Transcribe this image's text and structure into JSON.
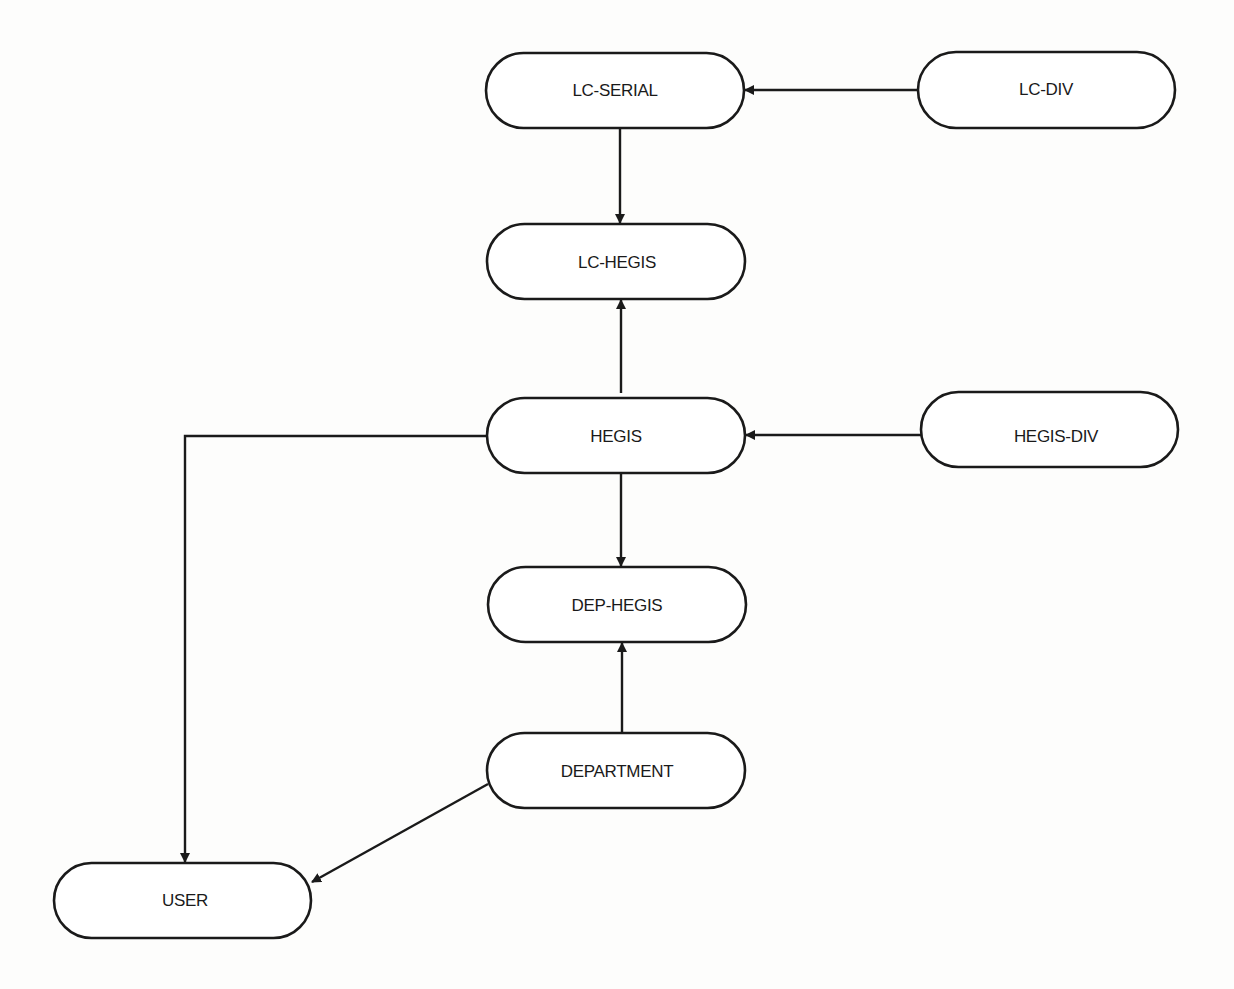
{
  "diagram": {
    "type": "entity-relationship / dependency diagram",
    "colors": {
      "background": "#fdfdfc",
      "stroke": "#1a1a1a",
      "node_fill": "#ffffff",
      "text": "#1a1a1a"
    },
    "nodes": [
      {
        "id": "lc_serial",
        "label": "LC-SERIAL",
        "x": 486,
        "y": 53,
        "w": 258,
        "h": 75
      },
      {
        "id": "lc_div",
        "label": "LC-DIV",
        "x": 918,
        "y": 52,
        "w": 257,
        "h": 76
      },
      {
        "id": "lc_hegis",
        "label": "LC-HEGIS",
        "x": 487,
        "y": 224,
        "w": 258,
        "h": 75
      },
      {
        "id": "hegis",
        "label": "HEGIS",
        "x": 487,
        "y": 398,
        "w": 258,
        "h": 75
      },
      {
        "id": "hegis_div",
        "label": "HEGIS-DIV",
        "x": 921,
        "y": 392,
        "w": 257,
        "h": 75
      },
      {
        "id": "dep_hegis",
        "label": "DEP-HEGIS",
        "x": 488,
        "y": 567,
        "w": 258,
        "h": 75
      },
      {
        "id": "department",
        "label": "DEPARTMENT",
        "x": 487,
        "y": 733,
        "w": 258,
        "h": 75
      },
      {
        "id": "user",
        "label": "USER",
        "x": 54,
        "y": 863,
        "w": 257,
        "h": 75
      }
    ],
    "edges": [
      {
        "from": "LC-DIV",
        "to": "LC-SERIAL",
        "path": "M918,90 L745,90"
      },
      {
        "from": "LC-SERIAL",
        "to": "LC-HEGIS",
        "path": "M620,128 L620,223"
      },
      {
        "from": "HEGIS",
        "to": "LC-HEGIS",
        "path": "M621,393 L621,300"
      },
      {
        "from": "HEGIS-DIV",
        "to": "HEGIS",
        "path": "M921,435 L746,435"
      },
      {
        "from": "HEGIS",
        "to": "DEP-HEGIS",
        "path": "M621,473 L621,566"
      },
      {
        "from": "DEPARTMENT",
        "to": "DEP-HEGIS",
        "path": "M622,733 L622,643"
      },
      {
        "from": "HEGIS",
        "to": "USER",
        "path": "M487,436 L185,436 L185,862"
      },
      {
        "from": "DEPARTMENT",
        "to": "USER",
        "path": "M488,784 L312,882"
      }
    ]
  }
}
